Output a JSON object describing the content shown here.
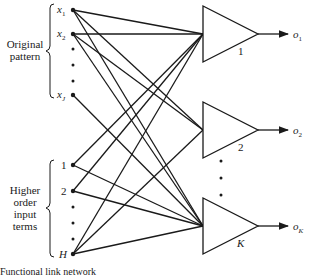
{
  "groups": {
    "original": {
      "label_line1": "Original",
      "label_line2": "pattern"
    },
    "higher": {
      "label_line1": "Higher",
      "label_line2": "order",
      "label_line3": "input",
      "label_line4": "terms"
    }
  },
  "inputs": {
    "original": [
      {
        "label": "x",
        "sub": "1",
        "y": 10
      },
      {
        "label": "x",
        "sub": "2",
        "y": 34
      },
      {
        "label": "x",
        "sub": "J",
        "y": 95
      }
    ],
    "higher": [
      {
        "label": "1",
        "y": 165
      },
      {
        "label": "2",
        "y": 191
      },
      {
        "label": "H",
        "y": 254
      }
    ]
  },
  "outputs": [
    {
      "unit_label": "1",
      "out_label": "o",
      "out_sub": "1",
      "cy": 34
    },
    {
      "unit_label": "2",
      "out_label": "o",
      "out_sub": "2",
      "cy": 130
    },
    {
      "unit_label": "K",
      "out_label": "o",
      "out_sub": "K",
      "cy": 226
    }
  ],
  "caption": "Functional link network"
}
